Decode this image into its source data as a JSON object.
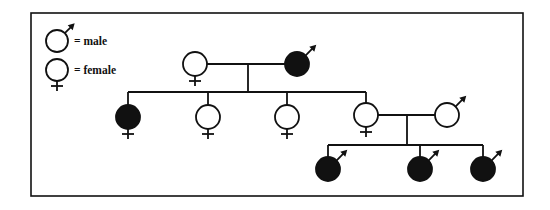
{
  "frame": {
    "x": 31,
    "y": 13,
    "width": 492,
    "height": 183
  },
  "colors": {
    "stroke": "#111111",
    "affected": "#111111",
    "unaffected": "#ffffff",
    "background": "#ffffff"
  },
  "legend": {
    "items": [
      {
        "symbol": "male",
        "label": "= male",
        "cx": 57,
        "cy": 41
      },
      {
        "symbol": "female",
        "label": "= female",
        "cx": 57,
        "cy": 70
      }
    ]
  },
  "pedigree": {
    "generations": [
      {
        "level": "I",
        "individuals": [
          {
            "id": "I-1",
            "sex": "female",
            "affected": false,
            "cx": 195,
            "cy": 64
          },
          {
            "id": "I-2",
            "sex": "male",
            "affected": true,
            "cx": 297,
            "cy": 64
          }
        ]
      },
      {
        "level": "II",
        "individuals": [
          {
            "id": "II-1",
            "sex": "female",
            "affected": true,
            "cx": 128,
            "cy": 117
          },
          {
            "id": "II-2",
            "sex": "female",
            "affected": false,
            "cx": 208,
            "cy": 117
          },
          {
            "id": "II-3",
            "sex": "female",
            "affected": false,
            "cx": 287,
            "cy": 117
          },
          {
            "id": "II-4",
            "sex": "female",
            "affected": false,
            "cx": 366,
            "cy": 115
          },
          {
            "id": "II-5",
            "sex": "male",
            "affected": false,
            "cx": 447,
            "cy": 115
          }
        ]
      },
      {
        "level": "III",
        "individuals": [
          {
            "id": "III-1",
            "sex": "male",
            "affected": true,
            "cx": 328,
            "cy": 169
          },
          {
            "id": "III-2",
            "sex": "male",
            "affected": true,
            "cx": 420,
            "cy": 169
          },
          {
            "id": "III-3",
            "sex": "male",
            "affected": true,
            "cx": 483,
            "cy": 169
          }
        ]
      }
    ],
    "lines": [
      {
        "id": "mating-I",
        "x1": 207,
        "y1": 64,
        "x2": 285,
        "y2": 64
      },
      {
        "id": "descent-I",
        "x1": 248,
        "y1": 64,
        "x2": 248,
        "y2": 92
      },
      {
        "id": "sibship-II",
        "x1": 128,
        "y1": 92,
        "x2": 366,
        "y2": 92
      },
      {
        "id": "drop-II-1",
        "x1": 128,
        "y1": 92,
        "x2": 128,
        "y2": 105
      },
      {
        "id": "drop-II-2",
        "x1": 208,
        "y1": 92,
        "x2": 208,
        "y2": 105
      },
      {
        "id": "drop-II-3",
        "x1": 287,
        "y1": 92,
        "x2": 287,
        "y2": 105
      },
      {
        "id": "drop-II-4",
        "x1": 366,
        "y1": 92,
        "x2": 366,
        "y2": 103
      },
      {
        "id": "mating-II",
        "x1": 378,
        "y1": 115,
        "x2": 435,
        "y2": 115
      },
      {
        "id": "descent-II",
        "x1": 407,
        "y1": 115,
        "x2": 407,
        "y2": 145
      },
      {
        "id": "sibship-III",
        "x1": 328,
        "y1": 145,
        "x2": 483,
        "y2": 145
      },
      {
        "id": "drop-III-1",
        "x1": 328,
        "y1": 145,
        "x2": 328,
        "y2": 157
      },
      {
        "id": "drop-III-2",
        "x1": 420,
        "y1": 145,
        "x2": 420,
        "y2": 157
      },
      {
        "id": "drop-III-3",
        "x1": 483,
        "y1": 145,
        "x2": 483,
        "y2": 157
      }
    ],
    "symbol_radius": 12
  }
}
